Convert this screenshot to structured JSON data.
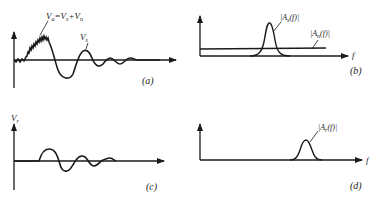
{
  "panels": {
    "a": {
      "caption": "(a)",
      "label_total_main": "V",
      "label_total_sub": "a",
      "label_eq": "=",
      "label_s_main": "V",
      "label_s_sub": "s",
      "label_plus": "+",
      "label_n_main": "V",
      "label_n_sub": "n",
      "label_vs_main": "V",
      "label_vs_sub": "s"
    },
    "b": {
      "caption": "(b)",
      "axis_label": "f",
      "label_as": "|A",
      "label_as_sub": "s",
      "label_as_tail": "(f)|",
      "label_an": "|A",
      "label_an_sub": "n",
      "label_an_tail": "(f)|"
    },
    "c": {
      "caption": "(c)",
      "label_vr_main": "V",
      "label_vr_sub": "r"
    },
    "d": {
      "caption": "(d)",
      "axis_label": "f",
      "label_ar": "|A",
      "label_ar_sub": "r",
      "label_ar_tail": "(f)|"
    }
  },
  "colors": {
    "ink": "#1a1a1a",
    "background": "#ffffff"
  }
}
